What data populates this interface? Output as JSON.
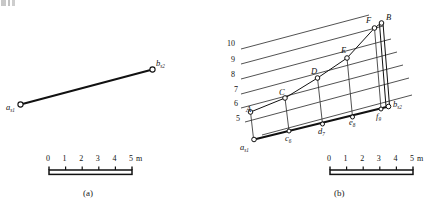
{
  "figure": {
    "panels": [
      {
        "caption": "(a)",
        "description": "Plan view showing straight line from station a to station b",
        "endpoints": [
          {
            "name": "a",
            "label": "a",
            "subscript": "s1"
          },
          {
            "name": "b",
            "label": "b",
            "subscript": "s2"
          }
        ],
        "scale": {
          "ticks": [
            "0",
            "1",
            "2",
            "3",
            "4",
            "5"
          ],
          "unit": "m"
        }
      },
      {
        "caption": "(b)",
        "description": "Contoured plan with profile points A-F projected to base line points c-f",
        "contour_labels": [
          "10",
          "9",
          "8",
          "7",
          "6",
          "5"
        ],
        "surface_points": [
          "A",
          "B",
          "C",
          "D",
          "E",
          "F"
        ],
        "base_points": [
          {
            "label": "a",
            "subscript": "s1"
          },
          {
            "label": "c",
            "subscript": "6"
          },
          {
            "label": "d",
            "subscript": "7"
          },
          {
            "label": "e",
            "subscript": "8"
          },
          {
            "label": "f",
            "subscript": "9"
          },
          {
            "label": "b",
            "subscript": "s2"
          }
        ],
        "scale": {
          "ticks": [
            "0",
            "1",
            "2",
            "3",
            "4",
            "5"
          ],
          "unit": "m"
        }
      }
    ]
  },
  "colors": {
    "ink": "#111111",
    "contour": "#3a3a3a",
    "background": "#ffffff"
  }
}
